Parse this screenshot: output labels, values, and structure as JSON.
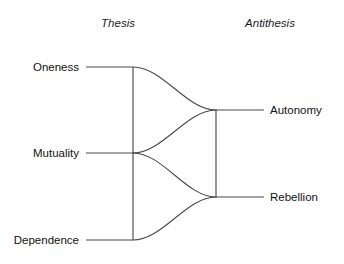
{
  "diagram": {
    "title": "",
    "background_color": "#ffffff",
    "line_color": "#4a4a4a",
    "text_color": "#121212",
    "columns": [
      {
        "id": "thesis",
        "label": "Thesis",
        "x": 118,
        "y": 27
      },
      {
        "id": "antithesis",
        "label": "Antithesis",
        "x": 270,
        "y": 27
      }
    ],
    "left_nodes": [
      {
        "id": "oneness",
        "label": "Oneness",
        "label_x": 79,
        "label_y": 71,
        "connector_x1": 86,
        "connector_x2": 133,
        "y": 67
      },
      {
        "id": "mutuality",
        "label": "Mutuality",
        "label_x": 79,
        "label_y": 157,
        "connector_x1": 86,
        "connector_x2": 133,
        "y": 153
      },
      {
        "id": "dependence",
        "label": "Dependence",
        "label_x": 79,
        "label_y": 244,
        "connector_x1": 86,
        "connector_x2": 133,
        "y": 240
      }
    ],
    "right_nodes": [
      {
        "id": "autonomy",
        "label": "Autonomy",
        "label_x": 270,
        "label_y": 114,
        "connector_x1": 216,
        "connector_x2": 264,
        "y": 110
      },
      {
        "id": "rebellion",
        "label": "Rebellion",
        "label_x": 270,
        "label_y": 201,
        "connector_x1": 216,
        "connector_x2": 264,
        "y": 197
      }
    ],
    "spines": [
      {
        "id": "left-spine",
        "x": 133,
        "y1": 67,
        "y2": 240
      },
      {
        "id": "right-spine",
        "x": 216,
        "y1": 110,
        "y2": 197
      }
    ],
    "curves": [
      {
        "id": "oneness-to-autonomy",
        "from": "oneness",
        "to": "autonomy",
        "path": "M 133 67 C 163 67 186 110 216 110"
      },
      {
        "id": "mutuality-to-autonomy",
        "from": "mutuality",
        "to": "autonomy",
        "path": "M 133 153 C 163 153 186 110 216 110"
      },
      {
        "id": "mutuality-to-rebellion",
        "from": "mutuality",
        "to": "rebellion",
        "path": "M 133 153 C 163 153 186 197 216 197"
      },
      {
        "id": "dependence-to-rebellion",
        "from": "dependence",
        "to": "rebellion",
        "path": "M 133 240 C 163 240 186 197 216 197"
      }
    ]
  }
}
